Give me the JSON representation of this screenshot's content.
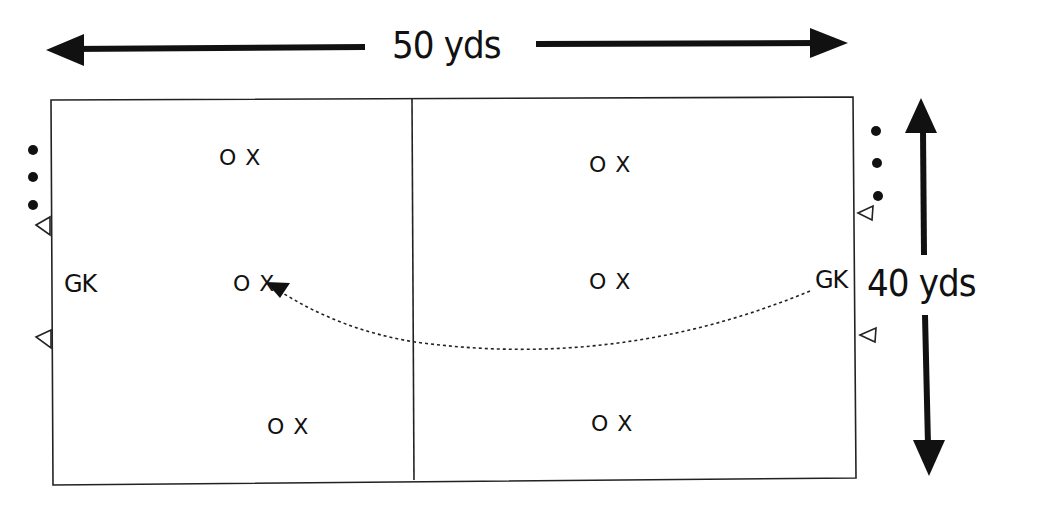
{
  "diagram": {
    "dimensions": {
      "width_label": "50 yds",
      "height_label": "40 yds"
    },
    "goalkeepers": [
      {
        "label": "GK",
        "side": "left"
      },
      {
        "label": "GK",
        "side": "right"
      }
    ],
    "players": [
      {
        "label": "O X",
        "half": "left",
        "position": "top"
      },
      {
        "label": "O X",
        "half": "left",
        "position": "middle"
      },
      {
        "label": "O X",
        "half": "left",
        "position": "bottom"
      },
      {
        "label": "O X",
        "half": "right",
        "position": "top"
      },
      {
        "label": "O X",
        "half": "right",
        "position": "middle"
      },
      {
        "label": "O X",
        "half": "right",
        "position": "bottom"
      }
    ],
    "pass_arrow": {
      "from": "right GK",
      "to": "left middle O X",
      "style": "dashed curve"
    },
    "markers": {
      "left_balls": 3,
      "right_balls": 3,
      "left_cones": 2,
      "right_cones": 2
    },
    "colors": {
      "ink": "#111111",
      "background": "#ffffff"
    }
  }
}
